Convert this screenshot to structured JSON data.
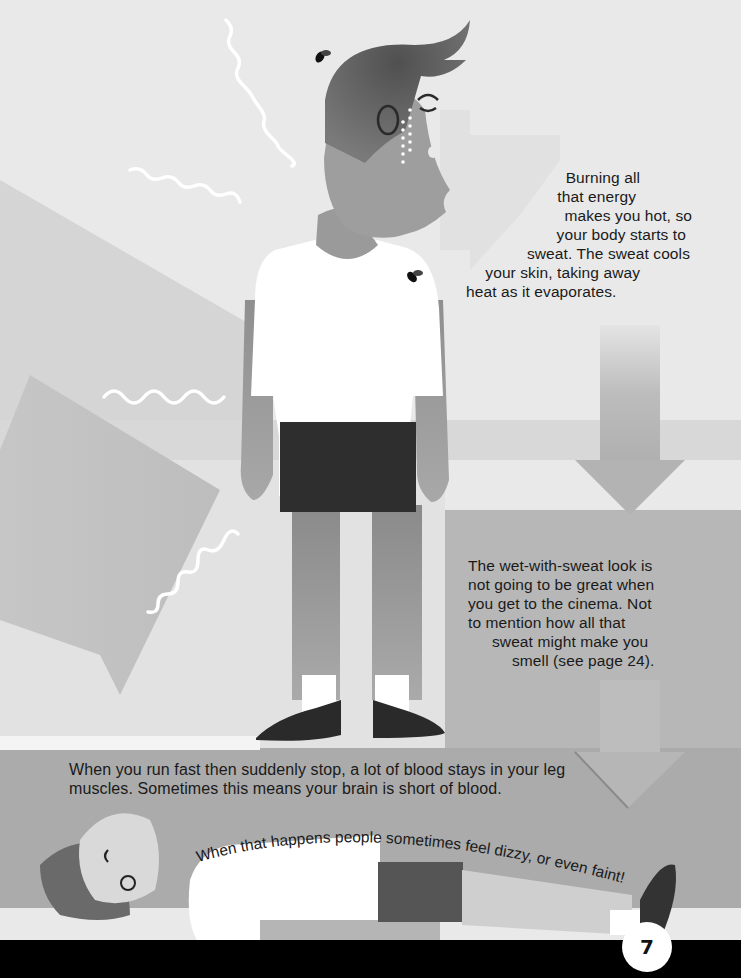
{
  "page": {
    "number": "7",
    "colors": {
      "background_light": "#e9e9e9",
      "background_mid": "#cfcfcf",
      "floor": "#a9a9a9",
      "footer_band": "#000000",
      "skin": "#9c9c9c",
      "hair": "#555555",
      "shirt": "#ffffff",
      "shorts": "#2e2e2e",
      "shoes": "#2a2a2a",
      "text": "#1a1a1a"
    }
  },
  "captions": {
    "sweat": {
      "lines": [
        "Burning all",
        "that energy",
        "makes you hot, so",
        "your body starts to",
        "sweat. The sweat cools",
        "your skin, taking away",
        "heat as it evaporates."
      ]
    },
    "smell": {
      "lines": [
        "The wet-with-sweat look is",
        "not going to be great when",
        "you get to the cinema. Not",
        "to mention how all that",
        "sweat might make you",
        "smell (see page 24)."
      ]
    },
    "blood": {
      "lines": [
        "When you run fast then suddenly stop, a lot of blood stays in your leg",
        "muscles. Sometimes this means your brain is short of blood."
      ]
    },
    "faint": {
      "text": "When that happens people sometimes feel dizzy, or even faint!"
    }
  },
  "illustrations": {
    "standing_boy": "standing-boy-sweating",
    "lying_boy": "boy-fainted-lying-down",
    "flies": [
      "fly-near-head",
      "fly-on-shirt"
    ],
    "arrows": [
      "arrow-right-behind-head",
      "arrow-right-left-side",
      "arrow-down-upper-right",
      "arrow-down-lower-right"
    ],
    "heat_waves": 4
  }
}
